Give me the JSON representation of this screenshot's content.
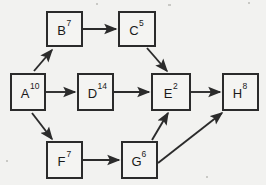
{
  "diagram": {
    "type": "directed-acyclic-graph",
    "title": "",
    "background_color": "#f2f2f0",
    "stroke_color": "#2b2b2b",
    "node_fill": "#f4f4f2",
    "node_label_format": "letter-with-superscript-weight",
    "nodes": [
      {
        "id": "A",
        "label": "A",
        "weight": "10",
        "x": 11,
        "y": 74,
        "w": 34,
        "h": 36
      },
      {
        "id": "B",
        "label": "B",
        "weight": "7",
        "x": 47,
        "y": 12,
        "w": 35,
        "h": 34
      },
      {
        "id": "C",
        "label": "C",
        "weight": "5",
        "x": 119,
        "y": 12,
        "w": 36,
        "h": 34
      },
      {
        "id": "D",
        "label": "D",
        "weight": "14",
        "x": 78,
        "y": 74,
        "w": 35,
        "h": 36
      },
      {
        "id": "E",
        "label": "E",
        "weight": "2",
        "x": 152,
        "y": 74,
        "w": 38,
        "h": 36
      },
      {
        "id": "F",
        "label": "F",
        "weight": "7",
        "x": 47,
        "y": 142,
        "w": 35,
        "h": 36
      },
      {
        "id": "G",
        "label": "G",
        "weight": "6",
        "x": 122,
        "y": 142,
        "w": 35,
        "h": 36
      },
      {
        "id": "H",
        "label": "H",
        "weight": "8",
        "x": 223,
        "y": 74,
        "w": 35,
        "h": 36
      }
    ],
    "edges": [
      {
        "from": "A",
        "to": "B",
        "x1": 34,
        "y1": 71,
        "x2": 52,
        "y2": 50
      },
      {
        "from": "A",
        "to": "D",
        "x1": 46,
        "y1": 92,
        "x2": 75,
        "y2": 92
      },
      {
        "from": "A",
        "to": "F",
        "x1": 32,
        "y1": 113,
        "x2": 52,
        "y2": 139
      },
      {
        "from": "B",
        "to": "C",
        "x1": 83,
        "y1": 29,
        "x2": 116,
        "y2": 29
      },
      {
        "from": "C",
        "to": "E",
        "x1": 147,
        "y1": 48,
        "x2": 167,
        "y2": 71
      },
      {
        "from": "D",
        "to": "E",
        "x1": 114,
        "y1": 92,
        "x2": 149,
        "y2": 92
      },
      {
        "from": "E",
        "to": "H",
        "x1": 191,
        "y1": 92,
        "x2": 220,
        "y2": 92
      },
      {
        "from": "F",
        "to": "G",
        "x1": 83,
        "y1": 160,
        "x2": 119,
        "y2": 160
      },
      {
        "from": "G",
        "to": "E",
        "x1": 152,
        "y1": 140,
        "x2": 168,
        "y2": 113
      },
      {
        "from": "G",
        "to": "H",
        "x1": 158,
        "y1": 163,
        "x2": 222,
        "y2": 113
      }
    ],
    "specks": [
      {
        "x": 96,
        "y": 3,
        "w": 2,
        "h": 2
      },
      {
        "x": 168,
        "y": 4,
        "w": 3,
        "h": 2
      },
      {
        "x": 248,
        "y": 2,
        "w": 2,
        "h": 2
      },
      {
        "x": 6,
        "y": 160,
        "w": 2,
        "h": 2
      },
      {
        "x": 206,
        "y": 176,
        "w": 2,
        "h": 2
      }
    ]
  }
}
